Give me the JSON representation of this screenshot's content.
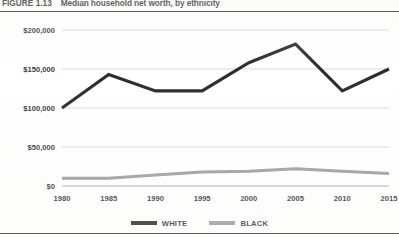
{
  "figure": {
    "number_label": "FIGURE 1.13",
    "title": "Median household net worth, by ethnicity"
  },
  "legend": {
    "position": "bottom-center",
    "items": [
      {
        "label": "WHITE",
        "color": "#100f0f",
        "swatch": "line-swatch"
      },
      {
        "label": "BLACK",
        "color": "#8d9095",
        "swatch": "line-swatch"
      }
    ]
  },
  "chart_data": {
    "type": "line",
    "title": "Median household net worth, by ethnicity",
    "xlabel": "",
    "ylabel": "",
    "x": [
      1980,
      1985,
      1990,
      1995,
      2000,
      2005,
      2010,
      2015
    ],
    "xtick_labels": [
      "1980",
      "1985",
      "1990",
      "1995",
      "2000",
      "2005",
      "2010",
      "2015"
    ],
    "ytick_values": [
      0,
      50000,
      100000,
      150000,
      200000
    ],
    "ytick_labels": [
      "$0",
      "$50,000",
      "$100,000",
      "$150,000",
      "$200,000"
    ],
    "ylim": [
      0,
      200000
    ],
    "xlim": [
      1980,
      2015
    ],
    "grid": true,
    "grid_axis": "y",
    "series": [
      {
        "name": "WHITE",
        "color": "#100f0f",
        "values": [
          100000,
          143000,
          122000,
          122000,
          158000,
          182000,
          122000,
          150000
        ]
      },
      {
        "name": "BLACK",
        "color": "#8d9095",
        "values": [
          10000,
          10000,
          14000,
          18000,
          19000,
          22000,
          19000,
          16000
        ]
      }
    ]
  }
}
